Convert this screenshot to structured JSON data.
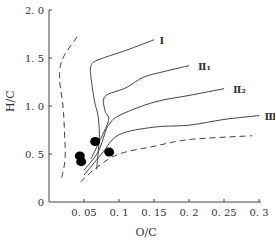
{
  "chart_data": {
    "type": "line",
    "title": "",
    "xlabel": "O/C",
    "ylabel": "H/C",
    "xlim": [
      0,
      0.3
    ],
    "ylim": [
      0,
      2.0
    ],
    "grid": false,
    "x_ticks": [
      "0.05",
      "0.1",
      "0.15",
      "0.2",
      "0.25",
      "0.3"
    ],
    "y_ticks": [
      "0",
      "0.5",
      "1.0",
      "1.5",
      "2.0"
    ],
    "series": [
      {
        "name": "Ⅰ",
        "style": "solid",
        "points": [
          [
            0.15,
            1.69
          ],
          [
            0.11,
            1.58
          ],
          [
            0.07,
            1.48
          ],
          [
            0.06,
            1.42
          ],
          [
            0.06,
            1.3
          ],
          [
            0.065,
            1.05
          ],
          [
            0.07,
            0.9
          ],
          [
            0.072,
            0.7
          ],
          [
            0.07,
            0.5
          ],
          [
            0.068,
            0.34
          ]
        ]
      },
      {
        "name": "Ⅱ₁",
        "style": "solid",
        "points": [
          [
            0.2,
            1.42
          ],
          [
            0.165,
            1.36
          ],
          [
            0.135,
            1.3
          ],
          [
            0.11,
            1.19
          ],
          [
            0.08,
            1.1
          ],
          [
            0.08,
            0.95
          ],
          [
            0.085,
            0.85
          ],
          [
            0.07,
            0.6
          ],
          [
            0.06,
            0.45
          ]
        ]
      },
      {
        "name": "Ⅱ₂",
        "style": "solid",
        "points": [
          [
            0.25,
            1.18
          ],
          [
            0.2,
            1.11
          ],
          [
            0.15,
            1.04
          ],
          [
            0.1,
            0.9
          ],
          [
            0.085,
            0.8
          ],
          [
            0.08,
            0.72
          ],
          [
            0.07,
            0.52
          ],
          [
            0.05,
            0.33
          ]
        ]
      },
      {
        "name": "Ⅲ",
        "style": "solid",
        "points": [
          [
            0.3,
            0.9
          ],
          [
            0.25,
            0.86
          ],
          [
            0.2,
            0.8
          ],
          [
            0.15,
            0.78
          ],
          [
            0.1,
            0.7
          ],
          [
            0.075,
            0.5
          ],
          [
            0.05,
            0.28
          ]
        ]
      },
      {
        "name": "boundary-left",
        "style": "dashed",
        "points": [
          [
            0.04,
            1.72
          ],
          [
            0.02,
            1.5
          ],
          [
            0.015,
            1.3
          ],
          [
            0.02,
            1.0
          ],
          [
            0.022,
            0.75
          ],
          [
            0.023,
            0.45
          ],
          [
            0.018,
            0.25
          ]
        ]
      },
      {
        "name": "boundary-bottom",
        "style": "dashed",
        "points": [
          [
            0.045,
            0.21
          ],
          [
            0.07,
            0.37
          ],
          [
            0.1,
            0.5
          ],
          [
            0.15,
            0.58
          ],
          [
            0.2,
            0.65
          ],
          [
            0.29,
            0.69
          ]
        ]
      }
    ],
    "markers": [
      {
        "x": 0.044,
        "y": 0.48
      },
      {
        "x": 0.046,
        "y": 0.42
      },
      {
        "x": 0.066,
        "y": 0.63
      },
      {
        "x": 0.086,
        "y": 0.52
      }
    ],
    "curve_labels": [
      {
        "text": "Ⅰ",
        "x": 0.155,
        "y": 1.69
      },
      {
        "text": "Ⅱ₁",
        "x": 0.21,
        "y": 1.42
      },
      {
        "text": "Ⅱ₂",
        "x": 0.26,
        "y": 1.18
      },
      {
        "text": "Ⅲ",
        "x": 0.305,
        "y": 0.9
      }
    ]
  }
}
